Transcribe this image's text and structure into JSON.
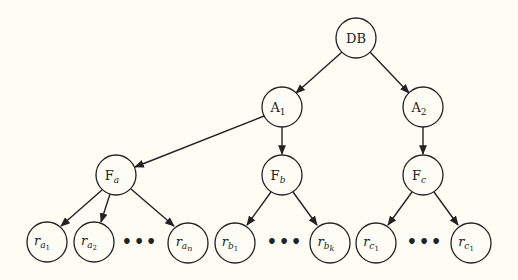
{
  "diagram": {
    "type": "tree",
    "nodes": {
      "db": {
        "label": "DB"
      },
      "a1": {
        "label": "A",
        "sub": "1"
      },
      "a2": {
        "label": "A",
        "sub": "2"
      },
      "fa": {
        "label": "F",
        "sub": "a"
      },
      "fb": {
        "label": "F",
        "sub": "b"
      },
      "fc": {
        "label": "F",
        "sub": "c"
      },
      "ra1": {
        "label": "r",
        "sub": "a",
        "subsub": "1"
      },
      "ra2": {
        "label": "r",
        "sub": "a",
        "subsub": "2"
      },
      "ran": {
        "label": "r",
        "sub": "a",
        "subsub": "n"
      },
      "rb1": {
        "label": "r",
        "sub": "b",
        "subsub": "1"
      },
      "rbk": {
        "label": "r",
        "sub": "b",
        "subsub": "k"
      },
      "rc1": {
        "label": "r",
        "sub": "c",
        "subsub": "1"
      },
      "rc1b": {
        "label": "r",
        "sub": "c",
        "subsub": "1"
      }
    },
    "ellipsis": "•••",
    "edges": [
      [
        "DB",
        "A1"
      ],
      [
        "DB",
        "A2"
      ],
      [
        "A1",
        "Fa"
      ],
      [
        "A1",
        "Fb"
      ],
      [
        "A2",
        "Fc"
      ],
      [
        "Fa",
        "ra1"
      ],
      [
        "Fa",
        "ra2"
      ],
      [
        "Fa",
        "ran"
      ],
      [
        "Fb",
        "rb1"
      ],
      [
        "Fb",
        "rbk"
      ],
      [
        "Fc",
        "rc1"
      ],
      [
        "Fc",
        "rc1"
      ]
    ]
  }
}
